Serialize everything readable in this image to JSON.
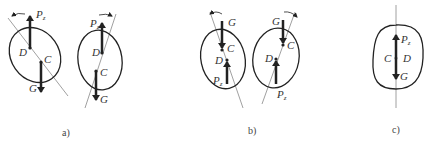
{
  "figure": {
    "panels": [
      {
        "id": "a",
        "caption": "a)",
        "bodies": [
          {
            "weight_label": "G",
            "thrust_label": "P",
            "thrust_subscript": "z",
            "center_label": "C",
            "point_label": "D",
            "rotation": "counter-clockwise"
          },
          {
            "weight_label": "G",
            "thrust_label": "P",
            "thrust_subscript": "z",
            "center_label": "C",
            "point_label": "D",
            "rotation": "clockwise"
          }
        ]
      },
      {
        "id": "b",
        "caption": "b)",
        "bodies": [
          {
            "weight_label": "G",
            "thrust_label": "P",
            "thrust_subscript": "z",
            "center_label": "C",
            "point_label": "D",
            "rotation": "counter-clockwise"
          },
          {
            "weight_label": "G",
            "thrust_label": "P",
            "thrust_subscript": "z",
            "center_label": "C",
            "point_label": "D",
            "rotation": "clockwise"
          }
        ]
      },
      {
        "id": "c",
        "caption": "c)",
        "bodies": [
          {
            "weight_label": "G",
            "thrust_label": "P",
            "thrust_subscript": "z",
            "center_label": "C",
            "point_label": "D",
            "rotation": "none"
          }
        ]
      }
    ]
  },
  "colors": {
    "stroke": "#222222",
    "axis": "#777777",
    "text": "#333333"
  }
}
